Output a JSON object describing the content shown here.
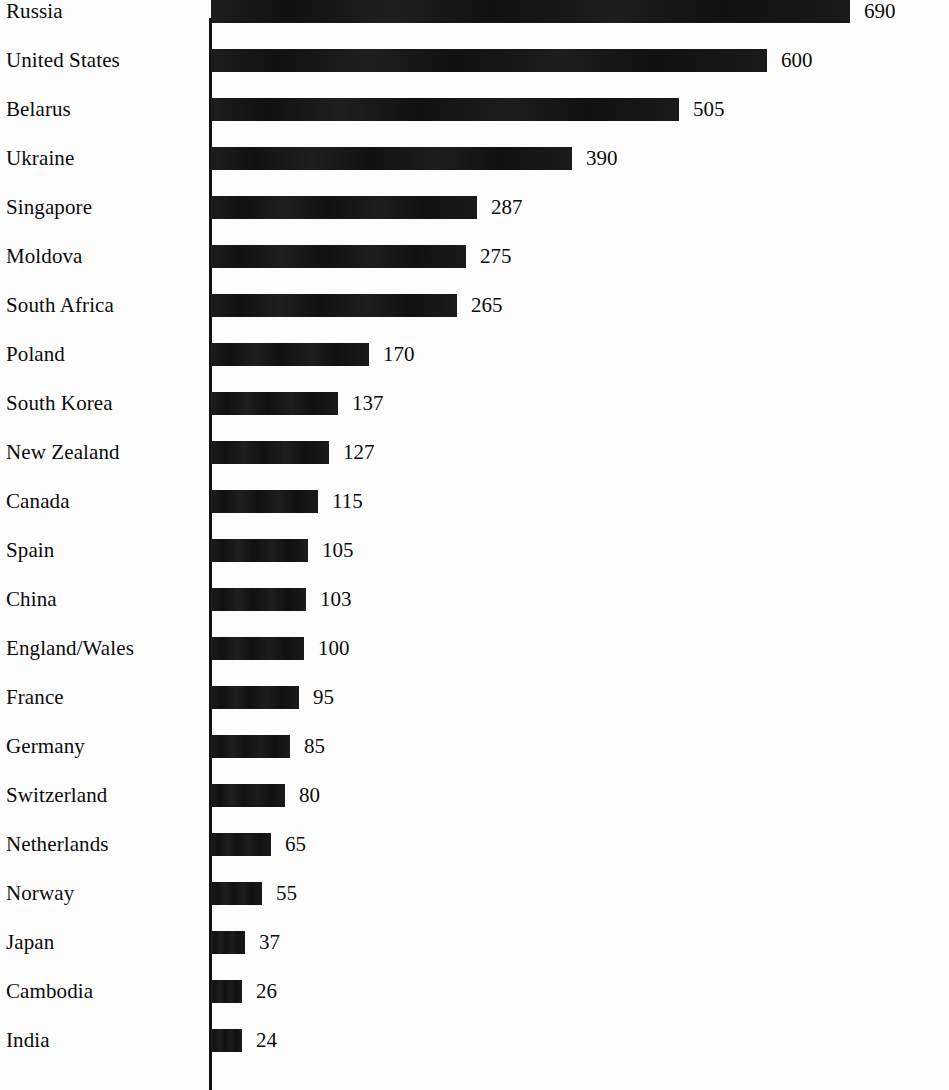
{
  "chart_data": {
    "type": "bar",
    "orientation": "horizontal",
    "title": "",
    "subtitle": "",
    "xlabel": "",
    "ylabel": "",
    "grid": false,
    "legend": null,
    "axis_line": "vertical category axis at left of bars",
    "value_label_position": "outside-end",
    "xlim": [
      0,
      690
    ],
    "categories": [
      "Russia",
      "United States",
      "Belarus",
      "Ukraine",
      "Singapore",
      "Moldova",
      "South Africa",
      "Poland",
      "South Korea",
      "New Zealand",
      "Canada",
      "Spain",
      "China",
      "England/Wales",
      "France",
      "Germany",
      "Switzerland",
      "Netherlands",
      "Norway",
      "Japan",
      "Cambodia",
      "India"
    ],
    "values": [
      690,
      600,
      505,
      390,
      287,
      275,
      265,
      170,
      137,
      127,
      115,
      105,
      103,
      100,
      95,
      85,
      80,
      65,
      55,
      37,
      26,
      24
    ],
    "value_labels": [
      "690",
      "600",
      "505",
      "390",
      "287",
      "275",
      "265",
      "170",
      "137",
      "127",
      "115",
      "105",
      "103",
      "100",
      "95",
      "85",
      "80",
      "65",
      "55",
      "37",
      "26",
      "24"
    ],
    "bar_color": "#111111",
    "background_color": "#fdfdfd"
  },
  "rows": [
    {
      "label": "Russia",
      "value": 690,
      "value_label": "690"
    },
    {
      "label": "United States",
      "value": 600,
      "value_label": "600"
    },
    {
      "label": "Belarus",
      "value": 505,
      "value_label": "505"
    },
    {
      "label": "Ukraine",
      "value": 390,
      "value_label": "390"
    },
    {
      "label": "Singapore",
      "value": 287,
      "value_label": "287"
    },
    {
      "label": "Moldova",
      "value": 275,
      "value_label": "275"
    },
    {
      "label": "South Africa",
      "value": 265,
      "value_label": "265"
    },
    {
      "label": "Poland",
      "value": 170,
      "value_label": "170"
    },
    {
      "label": "South Korea",
      "value": 137,
      "value_label": "137"
    },
    {
      "label": "New Zealand",
      "value": 127,
      "value_label": "127"
    },
    {
      "label": "Canada",
      "value": 115,
      "value_label": "115"
    },
    {
      "label": "Spain",
      "value": 105,
      "value_label": "105"
    },
    {
      "label": "China",
      "value": 103,
      "value_label": "103"
    },
    {
      "label": "England/Wales",
      "value": 100,
      "value_label": "100"
    },
    {
      "label": "France",
      "value": 95,
      "value_label": "95"
    },
    {
      "label": "Germany",
      "value": 85,
      "value_label": "85"
    },
    {
      "label": "Switzerland",
      "value": 80,
      "value_label": "80"
    },
    {
      "label": "Netherlands",
      "value": 65,
      "value_label": "65"
    },
    {
      "label": "Norway",
      "value": 55,
      "value_label": "55"
    },
    {
      "label": "Japan",
      "value": 37,
      "value_label": "37"
    },
    {
      "label": "Cambodia",
      "value": 26,
      "value_label": "26"
    },
    {
      "label": "India",
      "value": 24,
      "value_label": "24"
    }
  ],
  "layout": {
    "row_pitch": 49,
    "first_row_top": -13,
    "axis_x": 209,
    "bar_start_x": 211,
    "px_per_unit": 0.9265,
    "bar_min_px": 31,
    "value_gap_px": 14
  },
  "colors": {
    "bar": "#111111",
    "text": "#0b0b0b",
    "background": "#fdfdfd",
    "axis": "#111111"
  }
}
